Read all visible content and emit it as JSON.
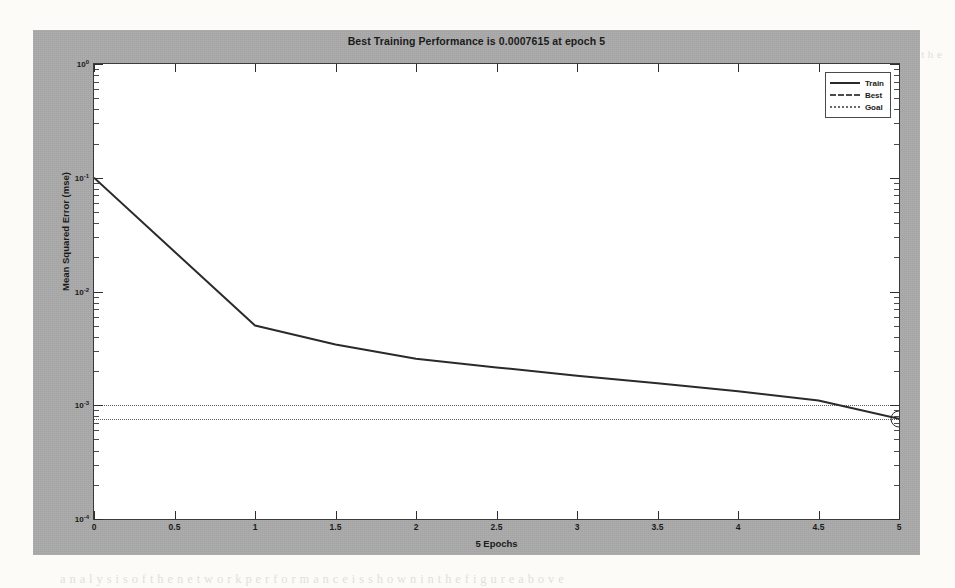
{
  "page": {
    "background_color": "#fcfbf8",
    "bleed_text": [
      {
        "t": "a n    t  e  r  r  o r    r a t e    w a s    o b t a i n e d    f o r    t h e",
        "x": 120,
        "y": 112,
        "s": 12,
        "faint": true
      },
      {
        "t": "n e t w o r k   t r a i n i n g    w i t h    t h e    c o n j u g a t e",
        "x": 300,
        "y": 138,
        "s": 12,
        "faint": true
      },
      {
        "t": "h e    p r o p o s e d    m o d e l    i s    v a l i d a t e d",
        "x": 215,
        "y": 290,
        "s": 12.5,
        "faint": false
      },
      {
        "t": "t h e    r e s u l t s    s h o w    t h a t",
        "x": 620,
        "y": 290,
        "s": 12.5,
        "faint": true
      },
      {
        "t": "n    e r r o r   c u r v e    c o n v e r g e s",
        "x": 250,
        "y": 320,
        "s": 12.5,
        "faint": true
      },
      {
        "t": "m e a n    s q u a r e d    e r r o r    r e a c h e s    a    m i n i m u m",
        "x": 170,
        "y": 455,
        "s": 12.5,
        "faint": false
      },
      {
        "t": "a n d  o n",
        "x": 760,
        "y": 455,
        "s": 12.5,
        "faint": false
      },
      {
        "t": "t h e   v a l i d a t i o n    s e t .    T h e    t r a i n i n g    p r o c e s s    s t o p s    a t    e p o c h",
        "x": 150,
        "y": 478,
        "s": 12.5,
        "faint": false
      },
      {
        "t": "a n a l y s i s    o f    t h e    n e t w o r k    p e r f o r m a n c e    i s    s h o w n    i n    t h e    f i g u r e    a b o v e",
        "x": 60,
        "y": 572,
        "s": 12.5,
        "faint": true
      },
      {
        "t": "o  f      t  h  e",
        "x": 905,
        "y": 48,
        "s": 11,
        "faint": true
      }
    ]
  },
  "figure": {
    "background_color": "#a9a9a9",
    "title": "Best Training Performance is 0.0007615 at epoch 5",
    "xlabel": "5 Epochs",
    "ylabel": "Mean Squared Error (mse)",
    "legend": {
      "items": [
        {
          "label": "Train",
          "style": "solid",
          "color": "#2a2a2a"
        },
        {
          "label": "Best",
          "style": "dashed",
          "color": "#4a4a4a"
        },
        {
          "label": "Goal",
          "style": "dotted",
          "color": "#6a6a6a"
        }
      ]
    }
  },
  "chart_data": {
    "type": "line",
    "title": "Best Training Performance is 0.0007615 at epoch 5",
    "xlabel": "5 Epochs",
    "ylabel": "Mean Squared Error (mse)",
    "yscale": "log",
    "xscale": "linear",
    "xlim": [
      0,
      5
    ],
    "ylim": [
      0.0001,
      1
    ],
    "grid": false,
    "legend_position": "top-right",
    "xticks": [
      0,
      0.5,
      1,
      1.5,
      2,
      2.5,
      3,
      3.5,
      4,
      4.5,
      5
    ],
    "xticklabels": [
      "0",
      "0.5",
      "1",
      "1.5",
      "2",
      "2.5",
      "3",
      "3.5",
      "4",
      "4.5",
      "5"
    ],
    "yticks": [
      1,
      0.1,
      0.01,
      0.001,
      0.0001
    ],
    "yticklabels": [
      "10 0",
      "10 -1",
      "10 -2",
      "10 -3",
      "10 -4"
    ],
    "yticklabels_mantissa": [
      "10",
      "10",
      "10",
      "10",
      "10"
    ],
    "yticklabels_exponent": [
      "0",
      "-1",
      "-2",
      "-3",
      "-4"
    ],
    "series": [
      {
        "name": "Train",
        "style": "solid",
        "color": "#2a2a2a",
        "x": [
          0,
          1,
          1.5,
          2,
          2.5,
          3,
          3.5,
          4,
          4.5,
          5
        ],
        "y": [
          0.1,
          0.00502,
          0.00342,
          0.00256,
          0.00215,
          0.00182,
          0.00156,
          0.00133,
          0.0011,
          0.0007615
        ]
      },
      {
        "name": "Best",
        "style": "dotted",
        "color": "#5d5d5d",
        "type": "hline",
        "y": 0.001
      },
      {
        "name": "Goal",
        "style": "dotted",
        "color": "#5d5d5d",
        "type": "hline",
        "y": 0.0007615
      }
    ],
    "marker": {
      "x": 5,
      "y": 0.0007615,
      "shape": "circle",
      "color": "#2a2a2a"
    },
    "best_value": 0.0007615,
    "best_epoch": 5,
    "total_epochs": 5
  }
}
